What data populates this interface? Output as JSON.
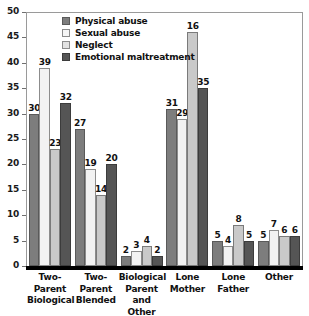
{
  "chart_data": {
    "type": "bar",
    "title": "",
    "xlabel": "",
    "ylabel": "",
    "ylim": [
      0,
      50
    ],
    "ytick_step": 5,
    "yticks": [
      "0",
      "5",
      "10",
      "15",
      "20",
      "25",
      "30",
      "35",
      "40",
      "45",
      "50"
    ],
    "grid": false,
    "legend_position": "top-left-inside",
    "categories": [
      "Two-\nParent\nBiological",
      "Two-\nParent\nBlended",
      "Biological\nParent\nand Other",
      "Lone\nMother",
      "Lone\nFather",
      "Other"
    ],
    "category_lines": [
      [
        "Two-",
        "Parent",
        "Biological"
      ],
      [
        "Two-",
        "Parent",
        "Blended"
      ],
      [
        "Biological",
        "Parent",
        "and Other"
      ],
      [
        "Lone",
        "Mother"
      ],
      [
        "Lone",
        "Father"
      ],
      [
        "Other"
      ]
    ],
    "series": [
      {
        "name": "Physical abuse",
        "color": "#7d7d7d",
        "values": [
          30,
          27,
          2,
          31,
          5,
          5
        ],
        "labels": [
          "30",
          "27",
          "2",
          "31",
          "5",
          "5"
        ]
      },
      {
        "name": "Sexual abuse",
        "color": "#f2f2f2",
        "values": [
          39,
          19,
          3,
          29,
          4,
          7
        ],
        "labels": [
          "39",
          "19",
          "3",
          "29",
          "4",
          "7"
        ]
      },
      {
        "name": "Neglect",
        "color": "#c9c9c9",
        "values": [
          23,
          14,
          4,
          46,
          8,
          6
        ],
        "labels": [
          "23",
          "14",
          "4",
          "16",
          "8",
          "6"
        ]
      },
      {
        "name": "Emotional maltreatment",
        "color": "#555555",
        "values": [
          32,
          20,
          2,
          35,
          5,
          6
        ],
        "labels": [
          "32",
          "20",
          "2",
          "35",
          "5",
          "6"
        ]
      }
    ]
  },
  "legend": {
    "items": [
      {
        "label": "Physical abuse"
      },
      {
        "label": "Sexual abuse"
      },
      {
        "label": "Neglect"
      },
      {
        "label": "Emotional maltreatment"
      }
    ]
  }
}
